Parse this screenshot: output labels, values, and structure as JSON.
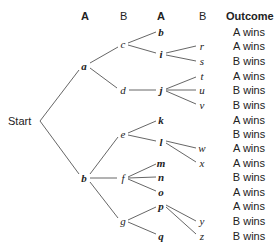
{
  "headers": {
    "col1": "A",
    "col2": "B",
    "col3": "A",
    "col4": "B",
    "outcome": "Outcome"
  },
  "start_label": "Start",
  "nodes": {
    "a": {
      "label": "a",
      "x": 84,
      "y": 66,
      "bold": true
    },
    "b1": {
      "label": "b",
      "x": 84,
      "y": 178,
      "bold": true
    },
    "c": {
      "label": "c",
      "x": 123,
      "y": 44
    },
    "d": {
      "label": "d",
      "x": 123,
      "y": 90
    },
    "e": {
      "label": "e",
      "x": 123,
      "y": 134
    },
    "f": {
      "label": "f",
      "x": 123,
      "y": 178
    },
    "g": {
      "label": "g",
      "x": 123,
      "y": 221
    },
    "b2": {
      "label": "b",
      "x": 161,
      "y": 32,
      "bold": true
    },
    "i": {
      "label": "i",
      "x": 161,
      "y": 54,
      "bold": true
    },
    "j": {
      "label": "j",
      "x": 161,
      "y": 90,
      "bold": true
    },
    "k": {
      "label": "k",
      "x": 161,
      "y": 120,
      "bold": true
    },
    "l": {
      "label": "l",
      "x": 161,
      "y": 142,
      "bold": true
    },
    "m": {
      "label": "m",
      "x": 161,
      "y": 163,
      "bold": true
    },
    "n": {
      "label": "n",
      "x": 161,
      "y": 177,
      "bold": true
    },
    "o": {
      "label": "o",
      "x": 161,
      "y": 192,
      "bold": true
    },
    "p": {
      "label": "p",
      "x": 161,
      "y": 206,
      "bold": true
    },
    "q": {
      "label": "q",
      "x": 161,
      "y": 236,
      "bold": true
    },
    "r": {
      "label": "r",
      "x": 202,
      "y": 46
    },
    "s": {
      "label": "s",
      "x": 202,
      "y": 61
    },
    "t": {
      "label": "t",
      "x": 202,
      "y": 76
    },
    "u": {
      "label": "u",
      "x": 202,
      "y": 90
    },
    "v": {
      "label": "v",
      "x": 202,
      "y": 105
    },
    "w": {
      "label": "w",
      "x": 202,
      "y": 148
    },
    "x": {
      "label": "x",
      "x": 202,
      "y": 163
    },
    "y": {
      "label": "y",
      "x": 202,
      "y": 221
    },
    "z": {
      "label": "z",
      "x": 202,
      "y": 236
    }
  },
  "outcomes": [
    "A wins",
    "A wins",
    "B wins",
    "A wins",
    "B wins",
    "B wins",
    "A wins",
    "B wins",
    "A wins",
    "A wins",
    "B wins",
    "A wins",
    "A wins",
    "B wins",
    "B wins"
  ],
  "line_color": "#555555"
}
